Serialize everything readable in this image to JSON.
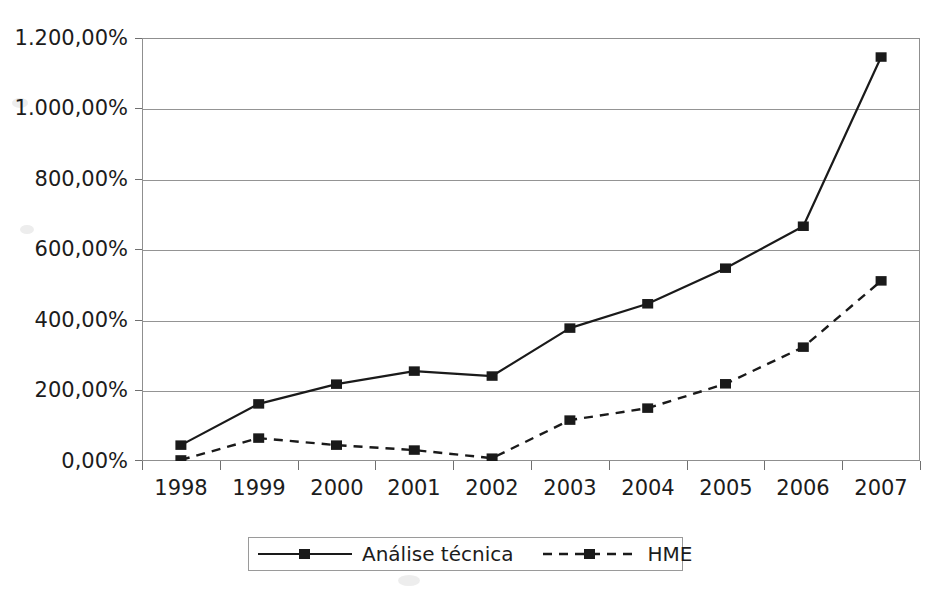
{
  "chart_data": {
    "type": "line",
    "title": "",
    "subtitle": "",
    "xlabel": "",
    "ylabel": "",
    "categories": [
      "1998",
      "1999",
      "2000",
      "2001",
      "2002",
      "2003",
      "2004",
      "2005",
      "2006",
      "2007"
    ],
    "series": [
      {
        "name": "Análise técnica",
        "line_style": "solid",
        "marker": "square",
        "color": "#1a1a1a",
        "values": [
          45,
          162,
          218,
          255,
          241,
          377,
          446,
          547,
          666,
          1146
        ]
      },
      {
        "name": "HME",
        "line_style": "dashed",
        "marker": "square",
        "color": "#1a1a1a",
        "values": [
          3,
          65,
          45,
          31,
          8,
          116,
          150,
          219,
          323,
          511
        ]
      }
    ],
    "ylim": [
      0,
      1200
    ],
    "ytick_values": [
      0,
      200,
      400,
      600,
      800,
      1000,
      1200
    ],
    "ytick_labels": [
      "0,00%",
      "200,00%",
      "400,00%",
      "600,00%",
      "800,00%",
      "1.000,00%",
      "1.200,00%"
    ],
    "grid": true,
    "grid_axis": "y",
    "legend_position": "bottom-center",
    "legend_entries": [
      "Análise técnica",
      "HME"
    ],
    "value_format": "percent",
    "decimal_separator": ",",
    "thousands_separator": "."
  },
  "legend": {
    "entries": [
      {
        "label": "Análise técnica",
        "style": "solid-line-with-square-marker"
      },
      {
        "label": "HME",
        "style": "dashed-line-with-square-marker"
      }
    ]
  },
  "colors": {
    "background": "#ffffff",
    "ink": "#1a1a1a",
    "grid": "#949494",
    "frame": "#8f8f8f"
  }
}
